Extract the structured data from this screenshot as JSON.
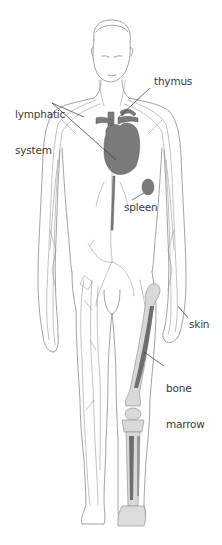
{
  "diagram": {
    "labels": [
      {
        "id": "lymphatic_system",
        "text_line1": "lymphatic",
        "text_line2": "system"
      },
      {
        "id": "thymus",
        "text": "thymus"
      },
      {
        "id": "spleen",
        "text": "spleen"
      },
      {
        "id": "skin",
        "text": "skin"
      },
      {
        "id": "bone_marrow",
        "text_line1": "bone",
        "text_line2": "marrow"
      }
    ],
    "colors": {
      "background": "#ffffff",
      "outline": "#8a8a8a",
      "lymph_vessel": "#9a9a9a",
      "organ_fill": "#7a7a7a",
      "bone_fill": "#d9d9d9",
      "marrow_fill": "#6e6e6e",
      "label_text": "#3a3a3a",
      "leader_line": "#333333"
    }
  }
}
